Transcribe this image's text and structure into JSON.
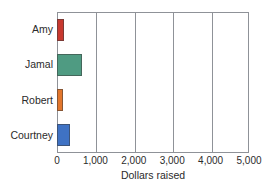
{
  "chart_data": {
    "type": "bar",
    "orientation": "horizontal",
    "title": "",
    "xlabel": "Dollars raised",
    "ylabel": "",
    "categories": [
      "Amy",
      "Jamal",
      "Robert",
      "Courtney"
    ],
    "values": [
      180,
      650,
      150,
      340
    ],
    "xlim": [
      0,
      5000
    ],
    "xticks": [
      0,
      1000,
      2000,
      3000,
      4000,
      5000
    ],
    "xtick_labels": [
      "0",
      "1,000",
      "2,000",
      "3,000",
      "4,000",
      "5,000"
    ],
    "grid": "vertical",
    "legend": "none",
    "bar_colors": [
      "#c8382f",
      "#4f9b82",
      "#e2762c",
      "#3f72c4"
    ],
    "bars": [
      {
        "label": "Amy",
        "value": 180,
        "color": "#c8382f"
      },
      {
        "label": "Jamal",
        "value": 650,
        "color": "#4f9b82"
      },
      {
        "label": "Robert",
        "value": 150,
        "color": "#e2762c"
      },
      {
        "label": "Courtney",
        "value": 340,
        "color": "#3f72c4"
      }
    ]
  },
  "axis": {
    "frame_color": "#8f9298",
    "bar_outline_color": "#3c3c3c"
  }
}
